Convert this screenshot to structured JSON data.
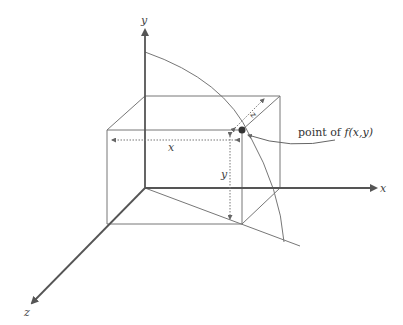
{
  "diagram": {
    "axes": {
      "x_label": "x",
      "y_label": "y",
      "z_label": "z"
    },
    "dimension_labels": {
      "x": "x",
      "y": "y",
      "z": "z"
    },
    "annotation": {
      "text_prefix": "point of ",
      "text_function": "f(x,y)"
    },
    "colors": {
      "line": "#666666",
      "axis": "#555555",
      "point": "#333333"
    }
  }
}
